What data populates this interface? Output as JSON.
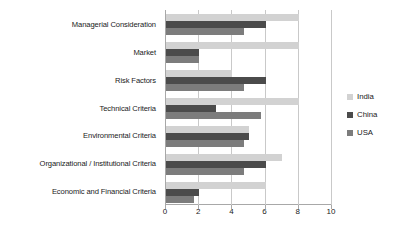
{
  "chart_data": {
    "type": "bar",
    "orientation": "horizontal",
    "title": "",
    "xlabel": "",
    "ylabel": "",
    "xlim": [
      0,
      10
    ],
    "xticks": [
      0,
      2,
      4,
      6,
      8,
      10
    ],
    "grid": true,
    "legend_position": "right",
    "categories": [
      "Managerial Consideration",
      "Market",
      "Risk Factors",
      "Technical Criteria",
      "Environmental Criteria",
      "Organizational / Institutional Criteria",
      "Economic and Financial Criteria"
    ],
    "series": [
      {
        "name": "India",
        "color": "#d2d2d2",
        "values": [
          8.0,
          8.0,
          4.0,
          8.0,
          5.0,
          7.0,
          6.0
        ]
      },
      {
        "name": "China",
        "color": "#4b4b4b",
        "values": [
          6.0,
          2.0,
          6.0,
          3.0,
          5.0,
          6.0,
          2.0
        ]
      },
      {
        "name": "USA",
        "color": "#7c7c7c",
        "values": [
          4.7,
          2.0,
          4.7,
          5.7,
          4.7,
          4.7,
          1.7
        ]
      }
    ]
  },
  "axis": {
    "x_tick_labels": [
      "0",
      "2",
      "4",
      "6",
      "8",
      "10"
    ]
  },
  "legend": {
    "items": [
      {
        "label": "India",
        "color": "#d2d2d2"
      },
      {
        "label": "China",
        "color": "#4b4b4b"
      },
      {
        "label": "USA",
        "color": "#7c7c7c"
      }
    ]
  }
}
